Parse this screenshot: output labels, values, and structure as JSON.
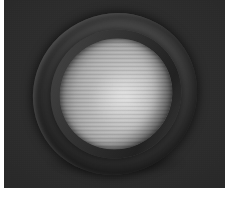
{
  "scene": {
    "title": "3D rendered hemispherical shell",
    "description": "A dark grey hemispherical bowl / dome shell tilted toward the viewer, showing a thick dark rim band around an elliptical opening and a bright, horizontally banded concave interior, lit from the upper left on a flat dark grey backdrop.",
    "render_type": "raster-3d-render",
    "canvas": {
      "width_px": 229,
      "height_px": 197,
      "render_area_width_px": 221,
      "render_area_height_px": 188,
      "page_margin_color": "#ffffff",
      "page_margin_left_px": 4,
      "page_margin_right_px": 4,
      "page_margin_bottom_px": 9
    },
    "background": {
      "name": "flat-dark-backdrop",
      "base_color": "#2b2b2b",
      "center_color": "#313131",
      "edge_color": "#222222",
      "has_grain": true,
      "has_vignette": true
    },
    "object": {
      "name": "hemisphere-shell",
      "shape": "hemispherical-bowl",
      "rotation_deg": -33,
      "bounds": {
        "left_px": 28,
        "top_px": 14,
        "width_px": 166,
        "height_px": 160
      },
      "shell": {
        "name": "outer-shell-body",
        "highlight_color": "#6a6a6a",
        "mid_color": "#4a4a4a",
        "shadow_color": "#272727",
        "terminator_color": "#1e1e1e"
      },
      "rim": {
        "name": "rim-band",
        "thickness_px": 9,
        "color": "#353535",
        "lit_edge_color": "#5a5a5a",
        "shadow_edge_color": "#0a0a0a",
        "opening_width_px": 132,
        "opening_height_px": 128
      },
      "cavity": {
        "name": "concave-interior",
        "brightest_color": "#d6d6d6",
        "mid_color": "#a8a8a8",
        "darkest_color": "#3a3a3a",
        "banding": "horizontal",
        "band_period_px": 4,
        "specular_center_px": [
          115,
          95
        ]
      }
    },
    "lighting": {
      "key_light_direction": "upper-left",
      "specular_highlight_color": "#ffffff",
      "contact_shadow_color": "#000000"
    }
  }
}
